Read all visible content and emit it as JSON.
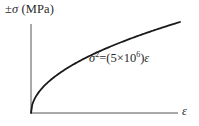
{
  "chart_data": {
    "type": "line",
    "title": "",
    "xlabel": "ε",
    "ylabel": "±σ (MPa)",
    "ylabel_parts": {
      "prefix": "±",
      "symbol": "σ",
      "unit": " (MPa)"
    },
    "annotation": {
      "text": "σ² = (5×10⁶)ε",
      "lhs_symbol": "σ",
      "lhs_exp": "2",
      "eq": "=(5×10",
      "exp": "6",
      "close": ")",
      "rhs_symbol": "ε"
    },
    "equation": "sigma^2 = 5e6 * epsilon",
    "grid": false,
    "legend": null,
    "ticks": {
      "x": [],
      "y": []
    },
    "series": [
      {
        "name": "σ² = (5×10⁶)ε",
        "shape": "square-root curve from origin, concave down",
        "color": "#1a1a1a"
      }
    ],
    "axes_color": "#555555"
  }
}
